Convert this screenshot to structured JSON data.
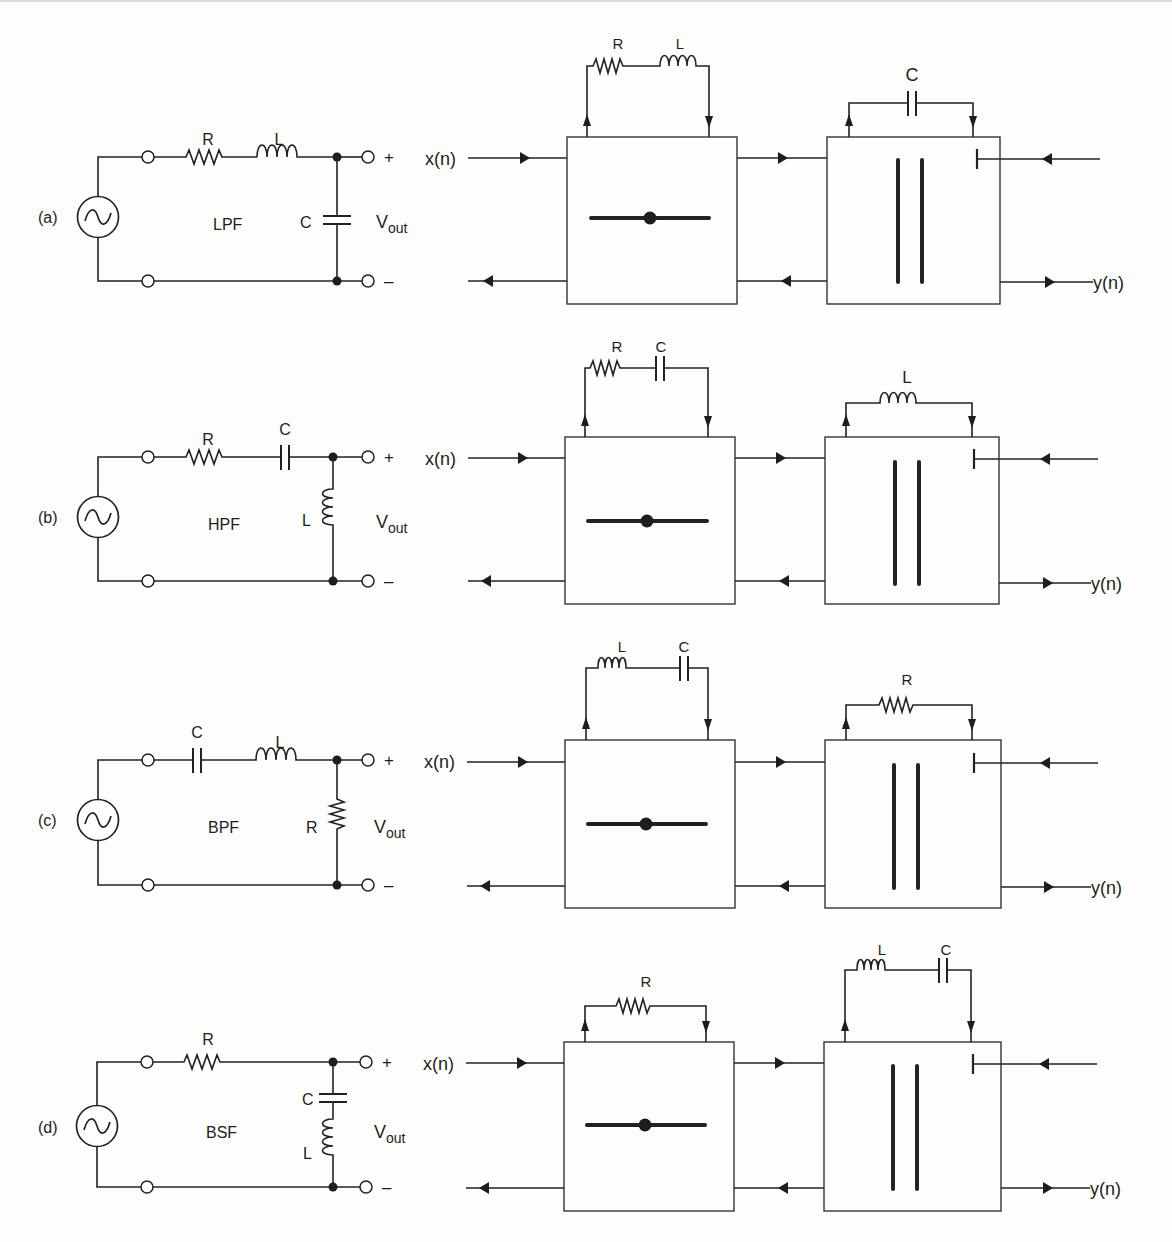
{
  "figure": {
    "rows": [
      {
        "id": "a",
        "tag": "(a)",
        "filter_type": "LPF",
        "analog": {
          "series_elements": [
            "R",
            "L"
          ],
          "shunt_elements": [
            "C"
          ],
          "output_label": "V",
          "output_sub": "out",
          "plus": "+",
          "minus": "–"
        },
        "digital": {
          "input": "x(n)",
          "output": "y(n)",
          "adaptor1_elements": [
            "R",
            "L"
          ],
          "adaptor2_elements": [
            "C"
          ]
        }
      },
      {
        "id": "b",
        "tag": "(b)",
        "filter_type": "HPF",
        "analog": {
          "series_elements": [
            "R",
            "C"
          ],
          "shunt_elements": [
            "L"
          ],
          "output_label": "V",
          "output_sub": "out",
          "plus": "+",
          "minus": "–"
        },
        "digital": {
          "input": "x(n)",
          "output": "y(n)",
          "adaptor1_elements": [
            "R",
            "C"
          ],
          "adaptor2_elements": [
            "L"
          ]
        }
      },
      {
        "id": "c",
        "tag": "(c)",
        "filter_type": "BPF",
        "analog": {
          "series_elements": [
            "C",
            "L"
          ],
          "shunt_elements": [
            "R"
          ],
          "output_label": "V",
          "output_sub": "out",
          "plus": "+",
          "minus": "–"
        },
        "digital": {
          "input": "x(n)",
          "output": "y(n)",
          "adaptor1_elements": [
            "L",
            "C"
          ],
          "adaptor2_elements": [
            "R"
          ]
        }
      },
      {
        "id": "d",
        "tag": "(d)",
        "filter_type": "BSF",
        "analog": {
          "series_elements": [
            "R"
          ],
          "shunt_elements": [
            "C",
            "L"
          ],
          "output_label": "V",
          "output_sub": "out",
          "plus": "+",
          "minus": "–"
        },
        "digital": {
          "input": "x(n)",
          "output": "y(n)",
          "adaptor1_elements": [
            "R"
          ],
          "adaptor2_elements": [
            "L",
            "C"
          ]
        }
      }
    ]
  }
}
